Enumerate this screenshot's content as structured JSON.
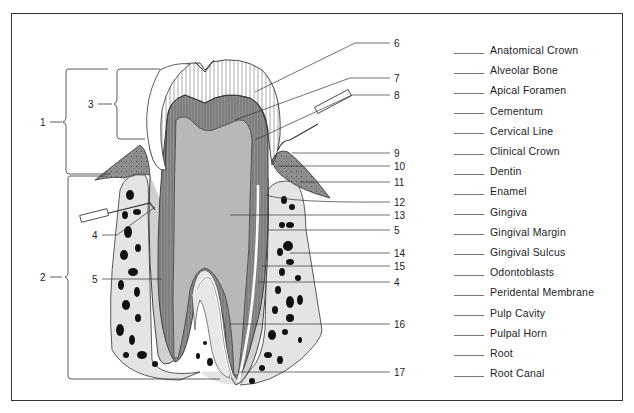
{
  "figure": {
    "type": "tooth cross-section labeling worksheet",
    "numbered_labels": [
      "1",
      "2",
      "3",
      "4",
      "4",
      "5",
      "5",
      "6",
      "7",
      "8",
      "9",
      "10",
      "11",
      "12",
      "13",
      "14",
      "15",
      "16",
      "17"
    ]
  },
  "labels": {
    "n1": "1",
    "n2": "2",
    "n3": "3",
    "n4a": "4",
    "n4b": "4",
    "n5a": "5",
    "n5b": "5",
    "n5c": "5",
    "n6": "6",
    "n7": "7",
    "n8": "8",
    "n9": "9",
    "n10": "10",
    "n11": "11",
    "n12": "12",
    "n13": "13",
    "n14": "14",
    "n15": "15",
    "n16": "16",
    "n17": "17"
  },
  "term_list": {
    "items": [
      {
        "blank": "",
        "term": "Anatomical Crown"
      },
      {
        "blank": "",
        "term": "Alveolar Bone"
      },
      {
        "blank": "",
        "term": "Apical Foramen"
      },
      {
        "blank": "",
        "term": "Cementum"
      },
      {
        "blank": "",
        "term": "Cervical Line"
      },
      {
        "blank": "",
        "term": "Clinical Crown"
      },
      {
        "blank": "",
        "term": "Dentin"
      },
      {
        "blank": "",
        "term": "Enamel"
      },
      {
        "blank": "",
        "term": "Gingiva"
      },
      {
        "blank": "",
        "term": "Gingival Margin"
      },
      {
        "blank": "",
        "term": "Gingival Sulcus"
      },
      {
        "blank": "",
        "term": "Odontoblasts"
      },
      {
        "blank": "",
        "term": "Peridental Membrane"
      },
      {
        "blank": "",
        "term": "Pulp Cavity"
      },
      {
        "blank": "",
        "term": "Pulpal Horn"
      },
      {
        "blank": "",
        "term": "Root"
      },
      {
        "blank": "",
        "term": "Root Canal"
      }
    ]
  },
  "colors": {
    "line": "#333333",
    "bone": "#e4e4e4",
    "dentin": "#9a9a9a",
    "pulp": "#b8b8b8",
    "gum": "#8e8e8e",
    "marrow": "#111111"
  }
}
